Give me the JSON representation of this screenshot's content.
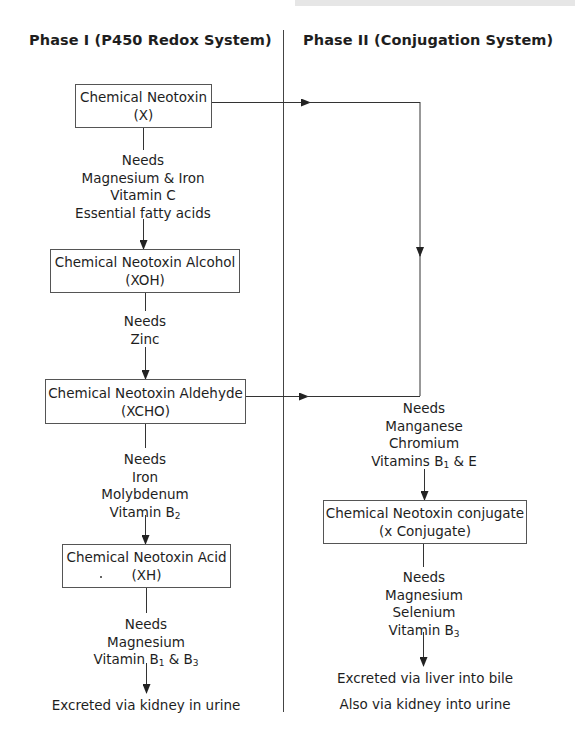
{
  "headings": {
    "phase1": "Phase I (P450 Redox System)",
    "phase2": "Phase II (Conjugation System)"
  },
  "phase1": {
    "boxes": [
      {
        "line1": "Chemical Neotoxin",
        "line2": "(X)"
      },
      {
        "line1": "Chemical Neotoxin Alcohol",
        "line2": "(XOH)"
      },
      {
        "line1": "Chemical Neotoxin Aldehyde",
        "line2": "(XCHO)"
      },
      {
        "line1": "Chemical Neotoxin Acid",
        "line2": "(XH)"
      }
    ],
    "needs": [
      {
        "title": "Needs",
        "items": [
          "Magnesium & Iron",
          "Vitamin C",
          "Essential fatty acids"
        ]
      },
      {
        "title": "Needs",
        "items": [
          "Zinc"
        ]
      },
      {
        "title": "Needs",
        "items": [
          "Iron",
          "Molybdenum",
          "Vitamin B",
          "2"
        ]
      },
      {
        "title": "Needs",
        "items": [
          "Magnesium",
          "Vitamin B",
          "1",
          " & B",
          "3"
        ]
      }
    ],
    "output": "Excreted via kidney in urine"
  },
  "phase2": {
    "needs_before": {
      "title": "Needs",
      "items": [
        "Manganese",
        "Chromium",
        "Vitamins B",
        "1",
        " & E"
      ]
    },
    "box": {
      "line1": "Chemical Neotoxin conjugate",
      "line2": "(x Conjugate)"
    },
    "needs_after": {
      "title": "Needs",
      "items": [
        "Magnesium",
        "Selenium",
        "Vitamin B",
        "3"
      ]
    },
    "output": [
      "Excreted via liver into bile",
      "Also via kidney into urine"
    ]
  },
  "colors": {
    "line": "#333333",
    "box_border": "#555555",
    "text": "#1e1e1e"
  }
}
